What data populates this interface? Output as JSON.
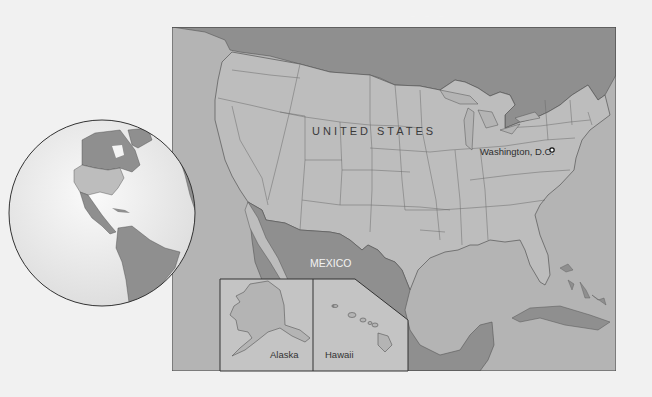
{
  "map": {
    "title": "United States location map",
    "colors": {
      "page_background": "#f1f1f1",
      "us_land": "#bdbdbd",
      "water": "#b4b4b4",
      "foreign_land": "#8f8f8f",
      "borders": "#555555",
      "globe_ocean": "#f4f4f4"
    },
    "labels": {
      "canada": "CANADA",
      "united_states": "UNITED STATES",
      "capital": "Washington, D.C.",
      "mexico": "MEXICO",
      "alaska": "Alaska",
      "hawaii": "Hawaii"
    },
    "markers": [
      {
        "name": "Washington, D.C.",
        "type": "capital-dot"
      }
    ],
    "insets": [
      "Alaska",
      "Hawaii"
    ],
    "locator_globe": {
      "region": "Western Hemisphere (Americas)",
      "highlight": "United States"
    }
  }
}
